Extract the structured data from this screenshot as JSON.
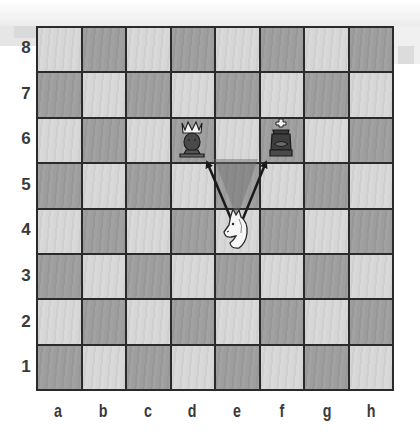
{
  "board": {
    "files": [
      "a",
      "b",
      "c",
      "d",
      "e",
      "f",
      "g",
      "h"
    ],
    "ranks": [
      "8",
      "7",
      "6",
      "5",
      "4",
      "3",
      "2",
      "1"
    ],
    "colors": {
      "light": "#d4d4d4",
      "dark": "#9c9c9c",
      "border": "#2a2a2a",
      "highlight": "#7a7a7a"
    }
  },
  "pieces": [
    {
      "square": "d6",
      "piece": "queen",
      "color": "black"
    },
    {
      "square": "f6",
      "piece": "king",
      "color": "black"
    },
    {
      "square": "e4",
      "piece": "knight",
      "color": "white"
    }
  ],
  "arrows": [
    {
      "from": "e4",
      "to": "d6"
    },
    {
      "from": "e4",
      "to": "f6"
    }
  ],
  "highlight": {
    "shape": "triangle",
    "area": "e5 (between d6 and f6 from e4)"
  },
  "caption": "Knight fork: white knight on e4 attacks queen on d6 and king on f6"
}
